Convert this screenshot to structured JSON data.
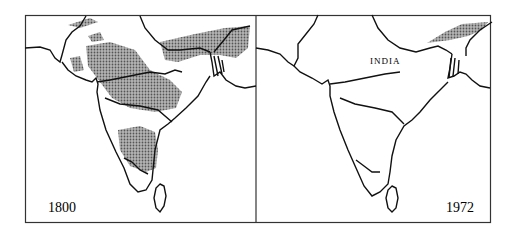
{
  "figure": {
    "panels": [
      {
        "id": "left",
        "year_label": "1800",
        "shading": "extensive stippled forest/range areas across north, central and southern India"
      },
      {
        "id": "right",
        "year_label": "1972",
        "country_label": "INDIA",
        "shading": "small stippled remnant in the northeast only"
      }
    ],
    "colors": {
      "frame": "#333333",
      "coast": "#111111",
      "stipple": "#8a8a8a",
      "background": "#ffffff"
    }
  }
}
